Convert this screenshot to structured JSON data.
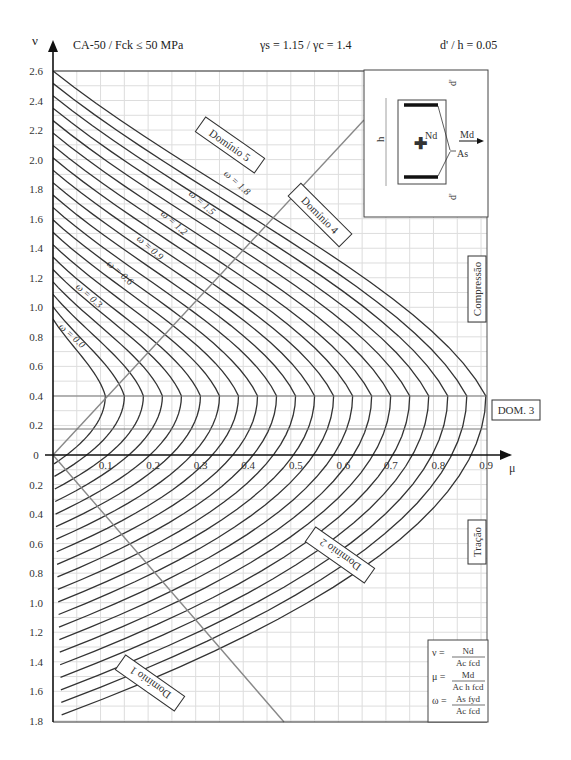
{
  "header": {
    "axis_y_symbol": "ν",
    "steel_concrete": "CA-50  / Fck ≤ 50 MPa",
    "safety_factors": "γs = 1.15 / γc = 1.4",
    "cover_ratio": "d' / h = 0.05"
  },
  "labels": {
    "domain_2": "Domínio 2",
    "domain_1": "Domínio 1",
    "domain_3": "DOM. 3",
    "domain_4": "Domínio 4",
    "domain_5": "Domínio 5",
    "compression": "Compressão",
    "tension": "Tração",
    "x_axis_symbol": "μ"
  },
  "inset": {
    "h": "h",
    "d_top": "d'",
    "d_bottom": "d'",
    "Nd": "Nd",
    "Md": "Md",
    "As": "As"
  },
  "formulas": [
    {
      "lhs": "ν =",
      "num": "Nd",
      "den": "Ac fcd"
    },
    {
      "lhs": "μ =",
      "num": "Md",
      "den": "Ac h fcd"
    },
    {
      "lhs": "ω =",
      "num": "As fyd",
      "den": "Ac fcd"
    }
  ],
  "chart_data": {
    "type": "line",
    "xlabel": "μ",
    "ylabel": "ν",
    "x_ticks": [
      "0.1",
      "0.2",
      "0.3",
      "0.4",
      "0.5",
      "0.6",
      "0.7",
      "0.8",
      "0.9"
    ],
    "y_ticks_compression": [
      "0",
      "0.2",
      "0.4",
      "0.6",
      "0.8",
      "1.0",
      "1.2",
      "1.4",
      "1.6",
      "1.8",
      "2.0",
      "2.2",
      "2.4",
      "2.6"
    ],
    "y_ticks_tension": [
      "0.2",
      "0.4",
      "0.6",
      "0.8",
      "1.0",
      "1.2",
      "1.4",
      "1.6",
      "1.8"
    ],
    "xlim": [
      0,
      0.92
    ],
    "ylim_compression": [
      0,
      2.6
    ],
    "ylim_tension": [
      0,
      1.8
    ],
    "grid": true,
    "omega_values": [
      0.0,
      0.1,
      0.2,
      0.3,
      0.4,
      0.5,
      0.6,
      0.7,
      0.8,
      0.9,
      1.0,
      1.1,
      1.2,
      1.3,
      1.4,
      1.5,
      1.6,
      1.7,
      1.8,
      1.9,
      2.0
    ],
    "omega_labels": [
      "ω = 0.0",
      "ω = 0.3",
      "ω = 0.6",
      "ω = 0.9",
      "ω = 1.2",
      "ω = 1.5",
      "ω = 1.8"
    ],
    "peak_nu": 0.4,
    "series_peak_mu": [
      0.11,
      0.15,
      0.19,
      0.24,
      0.28,
      0.33,
      0.37,
      0.42,
      0.46,
      0.51,
      0.55,
      0.6,
      0.64,
      0.69,
      0.73,
      0.78,
      0.82,
      0.87,
      0.91
    ]
  }
}
